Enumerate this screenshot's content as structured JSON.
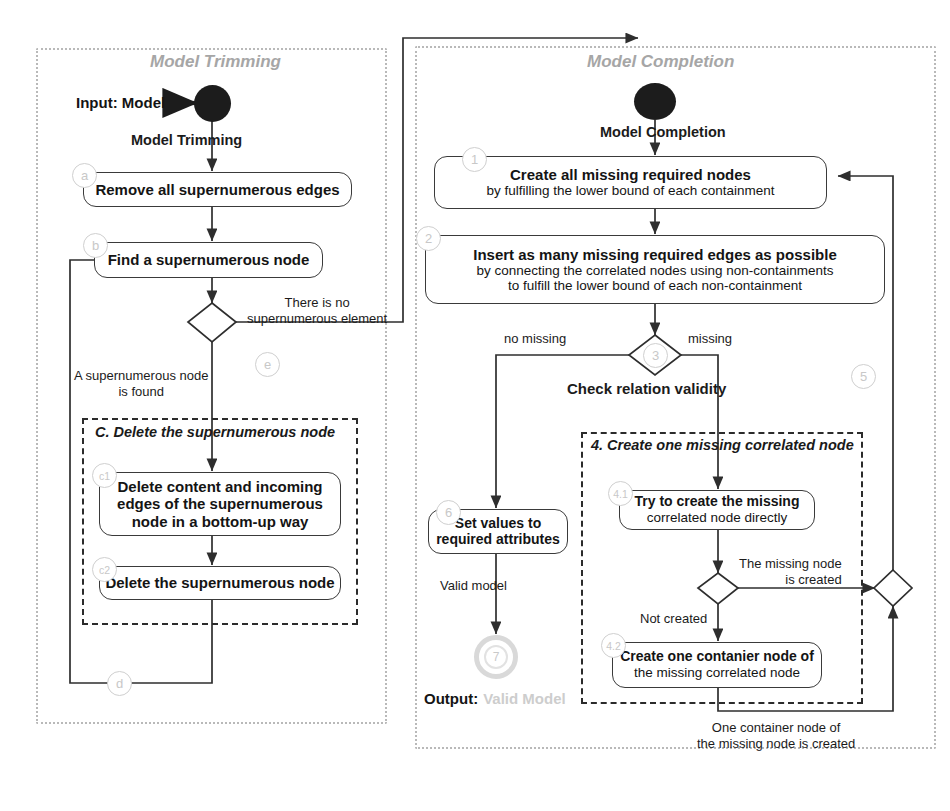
{
  "diagram": {
    "colors": {
      "panel_border": "#b9b9b9",
      "group_border": "#2b2b2b",
      "node_border": "#3a3a3a",
      "badge": "#cfcfcf",
      "start_fill": "#1c1c1c",
      "end_fill": "#d9d9d9",
      "text": "#231f20",
      "ghost_text": "#cdcdcd"
    }
  },
  "panels": [
    {
      "id": "trimming",
      "title": "Model Trimming"
    },
    {
      "id": "completion",
      "title": "Model Completion"
    }
  ],
  "trimming": {
    "input_label": "Input: Model",
    "flow_label": "Model Trimming",
    "steps": {
      "a": {
        "badge": "a",
        "line1": "Remove all supernumerous edges"
      },
      "b": {
        "badge": "b",
        "line1": "Find a supernumerous node"
      },
      "c1": {
        "badge": "c1",
        "line1": "Delete content and incoming",
        "line2": "edges of the supernumerous",
        "line3": "node in a bottom-up way"
      },
      "c2": {
        "badge": "c2",
        "line1": "Delete the supernumerous node"
      }
    },
    "decision": {
      "badge": "e"
    },
    "group_c": {
      "title": "C. Delete the supernumerous node"
    },
    "edge_labels": {
      "no_element_1": "There is no",
      "no_element_2": "supernumerous element",
      "found_1": "A supernumerous node",
      "found_2": "is found",
      "loop_badge": "d"
    }
  },
  "completion": {
    "flow_label": "Model Completion",
    "steps": {
      "s1": {
        "badge": "1",
        "line1": "Create all missing required nodes",
        "line2": "by fulfilling the lower bound of each containment"
      },
      "s2": {
        "badge": "2",
        "line1": "Insert as many missing required edges as possible",
        "line2": "by connecting the correlated nodes using non-containments",
        "line3": "to fulfill the lower bound of each non-containment"
      },
      "s41": {
        "badge": "4.1",
        "line1": "Try to create the missing",
        "line2": "correlated node directly"
      },
      "s42": {
        "badge": "4.2",
        "line1": "Create one contanier node of",
        "line2": "the missing correlated node"
      },
      "s6": {
        "badge": "6",
        "line1": "Set values to",
        "line2": "required attributes"
      }
    },
    "decision3": {
      "badge": "3",
      "caption": "Check relation validity"
    },
    "group_4": {
      "title": "4. Create one missing correlated node"
    },
    "loop_badge_5": "5",
    "end": {
      "badge": "7"
    },
    "output": {
      "label": "Output:",
      "value": "Valid Model"
    },
    "edge_labels": {
      "no_missing": "no missing",
      "missing": "missing",
      "node_created_1": "The missing node",
      "node_created_2": "is created",
      "not_created": "Not created",
      "valid_model": "Valid model",
      "container_created_1": "One container node of",
      "container_created_2": "the missing node is created"
    }
  }
}
